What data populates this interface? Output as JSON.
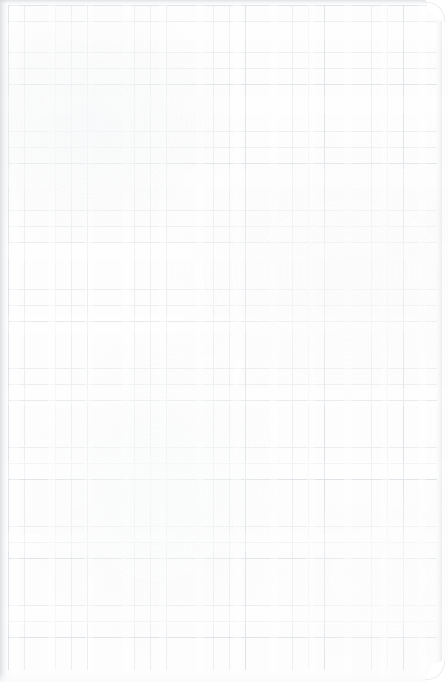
{
  "document": {
    "kind": "scanned-grid-paper",
    "surface_label": "blank graph paper sheet",
    "has_handwriting": false,
    "has_printed_text": false,
    "visible_text": "",
    "page_width_px": 448,
    "page_height_px": 682
  },
  "paper": {
    "background_color": "#fdfdfd",
    "outer_background_color": "#ffffff",
    "corner_radius_px": 18,
    "rounded_corners": [
      "top-right",
      "bottom-right"
    ],
    "square_corners": [
      "top-left",
      "bottom-left"
    ]
  },
  "grid": {
    "style": "square-grid",
    "cell_size_px": 15.8,
    "minor_line_color": "#cdd4da",
    "major_line_color": "#c4ccd3",
    "major_line_every_cells": 5,
    "line_width_px": 0.7,
    "content_left_px": 8,
    "content_top_px": 5,
    "content_width_px": 429,
    "content_height_px": 665,
    "columns_visible": 27,
    "rows_visible": 42
  },
  "edges": {
    "spine_shadow_side": "left",
    "spine_shadow_width_px": 9,
    "spine_shadow_color": "#c4c8cb",
    "top_edge_color": "#c6cace",
    "right_edge_color": "#d6dadd",
    "bottom_margin_color": "#fafafb"
  },
  "artifacts": {
    "scan_streaking": true,
    "streak_direction": "both",
    "paper_grain": true,
    "note": "faint vertical and horizontal banding typical of a flatbed scan"
  }
}
